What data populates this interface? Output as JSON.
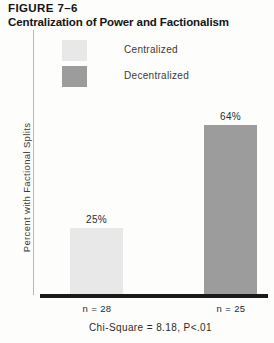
{
  "figure": {
    "number": "FIGURE 7–6",
    "title": "Centralization of Power and Factionalism"
  },
  "legend": {
    "items": [
      {
        "label": "Centralized",
        "color": "#e8e8e8"
      },
      {
        "label": "Decentralized",
        "color": "#9c9c9c"
      }
    ]
  },
  "axes": {
    "ylabel": "Percent with Factional Splits"
  },
  "footnote": "Chi-Square = 8.18, P<.01",
  "chart_data": {
    "type": "bar",
    "title": "Centralization of Power and Factionalism",
    "xlabel": "",
    "ylabel": "Percent with Factional Splits",
    "ylim": [
      0,
      100
    ],
    "grid": false,
    "legend_position": "top",
    "categories": [
      "Centralized",
      "Decentralized"
    ],
    "values": [
      25,
      64
    ],
    "value_labels": [
      "25%",
      "64%"
    ],
    "sample_sizes": [
      "n = 28",
      "n = 25"
    ],
    "colors": [
      "#e8e8e8",
      "#9c9c9c"
    ],
    "annotations": [
      "Chi-Square = 8.18, P<.01"
    ]
  }
}
